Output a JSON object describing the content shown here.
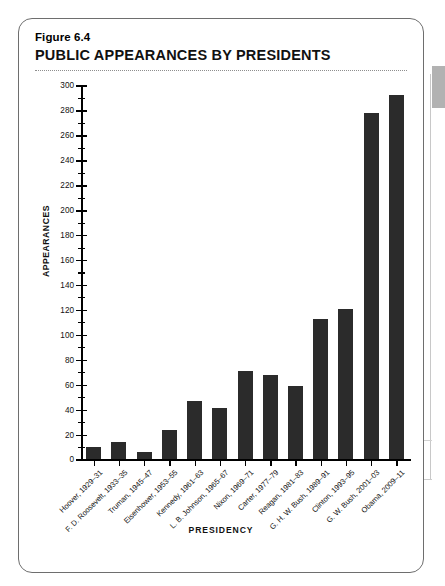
{
  "figure": {
    "number": "Figure 6.4",
    "title": "PUBLIC APPEARANCES BY PRESIDENTS"
  },
  "chart_data": {
    "type": "bar",
    "title": "PUBLIC APPEARANCES BY PRESIDENTS",
    "xlabel": "PRESIDENCY",
    "ylabel": "APPEARANCES",
    "ylim": [
      0,
      300
    ],
    "ytick_step": 20,
    "yminor_step": 10,
    "grid": false,
    "legend": null,
    "bar_color": "#2b2b2b",
    "categories": [
      "Hoover, 1929–31",
      "F. D. Roosevelt, 1933–35",
      "Truman, 1945–47",
      "Eisenhower, 1953–55",
      "Kennedy, 1961–63",
      "L. B. Johnson, 1965–67",
      "Nixon, 1969–71",
      "Carter, 1977–79",
      "Reagan, 1981–83",
      "G. H. W. Bush, 1989–91",
      "Clinton, 1993–95",
      "G. W. Bush, 2001–03",
      "Obama, 2009–11"
    ],
    "values": [
      10,
      14,
      6,
      24,
      47,
      41,
      71,
      68,
      59,
      113,
      121,
      278,
      292
    ],
    "ytick_labels": [
      "0",
      "20",
      "40",
      "60",
      "80",
      "100",
      "120",
      "140",
      "160",
      "180",
      "200",
      "220",
      "240",
      "260",
      "280",
      "300"
    ]
  }
}
